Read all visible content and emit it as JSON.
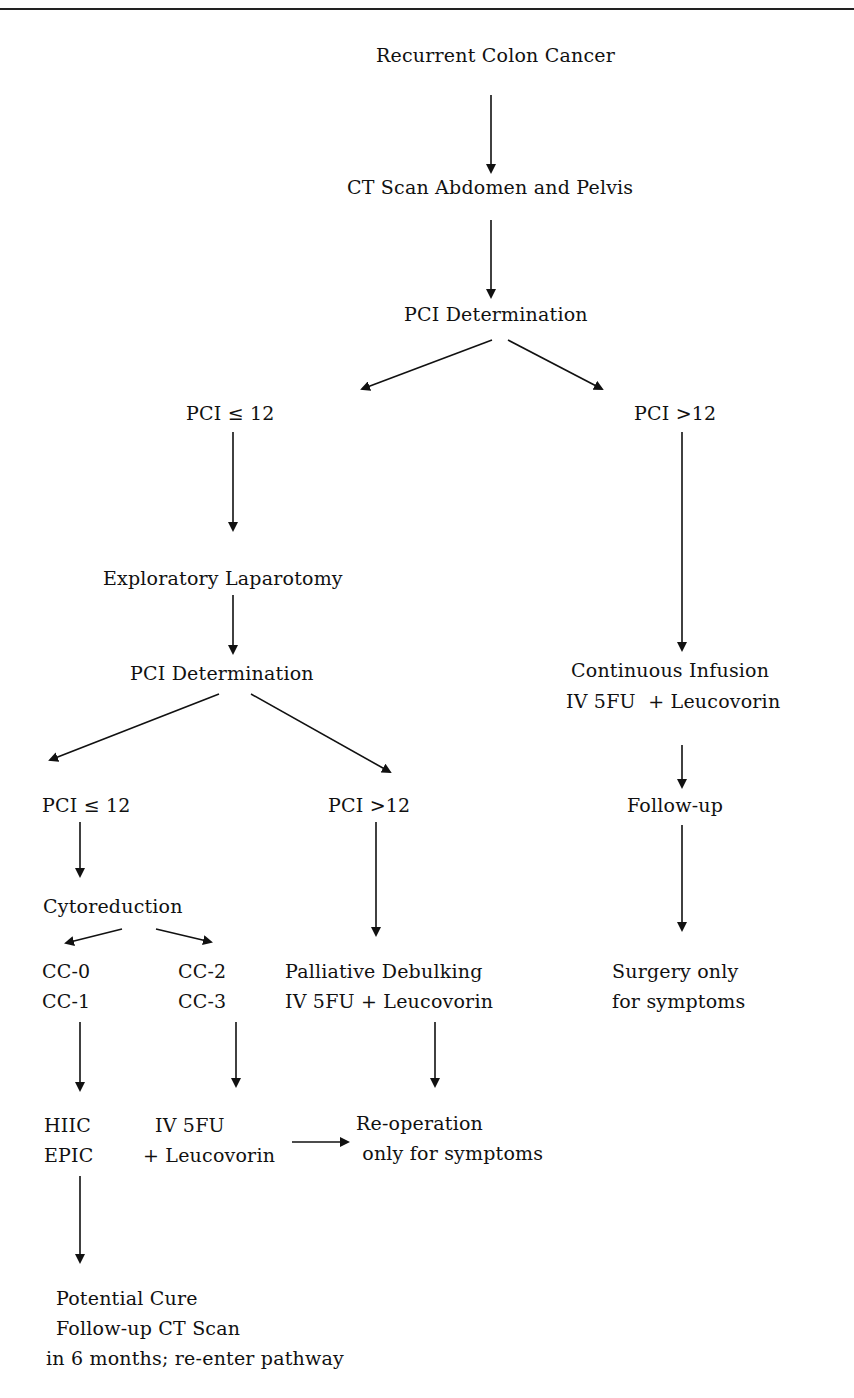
{
  "header": {
    "cutoff_text": "Surgery and Perioperative Chemotherapy"
  },
  "diagram": {
    "title": "Recurrent Colon Cancer",
    "nodes": {
      "recurrent": "Recurrent Colon Cancer",
      "ct_scan": "CT Scan Abdomen and Pelvis",
      "pci_det_1": "PCI Determination",
      "pci_le12_1": "PCI ≤ 12",
      "pci_gt12_1": "PCI >12",
      "exp_lap": "Exploratory Laparotomy",
      "pci_det_2": "PCI Determination",
      "cont_inf_1": "Continuous Infusion",
      "cont_inf_2": "IV 5FU  + Leucovorin",
      "follow_up": "Follow-up",
      "pci_le12_2": "PCI ≤ 12",
      "pci_gt12_2": "PCI >12",
      "cytoreduction": "Cytoreduction",
      "cc0": "CC-0",
      "cc1": "CC-1",
      "cc2": "CC-2",
      "cc3": "CC-3",
      "palliative_1": "Palliative Debulking",
      "palliative_2": "IV 5FU + Leucovorin",
      "surgery_1": "Surgery only",
      "surgery_2": "for symptoms",
      "hiic": "HIIC",
      "epic": "EPIC",
      "iv5fu_1": "IV 5FU",
      "iv5fu_2": "+ Leucovorin",
      "reop_1": "Re-operation",
      "reop_2": " only for symptoms",
      "cure_1": "Potential Cure",
      "cure_2": "Follow-up CT Scan",
      "cure_3": "in 6 months; re-enter pathway"
    }
  }
}
